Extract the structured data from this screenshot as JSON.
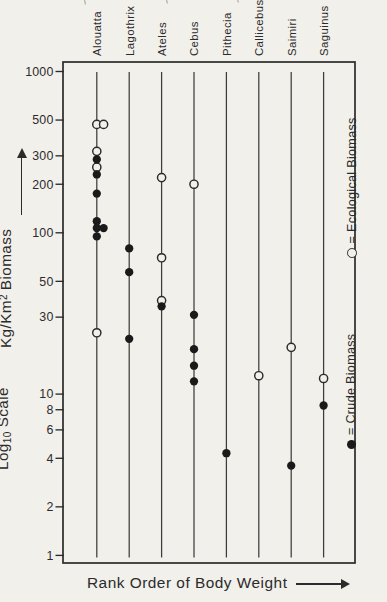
{
  "colors": {
    "paper": "#f2f0eb",
    "ink": "#2b2b2b",
    "line": "#3d3d3d"
  },
  "labels": {
    "y_primary": {
      "main": "Kg/Km",
      "sup": "2",
      "rest": "Biomass"
    },
    "y_secondary": {
      "main": "Log",
      "sub": "10",
      "rest": "Scale"
    },
    "x_axis": "Rank Order of Body Weight"
  },
  "legend": {
    "ecological": {
      "symbol": "open-circle",
      "text": "= Ecological Biomass"
    },
    "crude": {
      "symbol": "filled-circle",
      "text": "= Crude Biomass"
    }
  },
  "chart_data": {
    "type": "scatter",
    "y_scale": "log10",
    "ylim": [
      1,
      1000
    ],
    "y_ticks": [
      1000,
      500,
      300,
      200,
      100,
      50,
      30,
      10,
      8,
      6,
      4,
      2,
      1
    ],
    "xlabel": "Rank Order of Body Weight",
    "ylabel": "Kg/Km2 Biomass (Log10 Scale)",
    "legend_entries": [
      "o = Ecological Biomass",
      "• = Crude Biomass"
    ],
    "species": [
      {
        "name": "Alouatta",
        "ecological": [
          470,
          470,
          320,
          255,
          24
        ],
        "crude": [
          285,
          230,
          175,
          118,
          107,
          107,
          95
        ]
      },
      {
        "name": "Lagothrix",
        "ecological": [],
        "crude": [
          80,
          57,
          22
        ]
      },
      {
        "name": "Ateles",
        "ecological": [
          220,
          70,
          38
        ],
        "crude": [
          35
        ]
      },
      {
        "name": "Cebus",
        "ecological": [
          200
        ],
        "crude": [
          31,
          19,
          15,
          12
        ]
      },
      {
        "name": "Pithecia",
        "ecological": [],
        "crude": [
          4.3
        ]
      },
      {
        "name": "Callicebus",
        "ecological": [
          13
        ],
        "crude": []
      },
      {
        "name": "Saimiri",
        "ecological": [
          19.5
        ],
        "crude": [
          3.6
        ]
      },
      {
        "name": "Saguinus",
        "ecological": [
          12.5
        ],
        "crude": [
          8.5
        ]
      }
    ]
  }
}
